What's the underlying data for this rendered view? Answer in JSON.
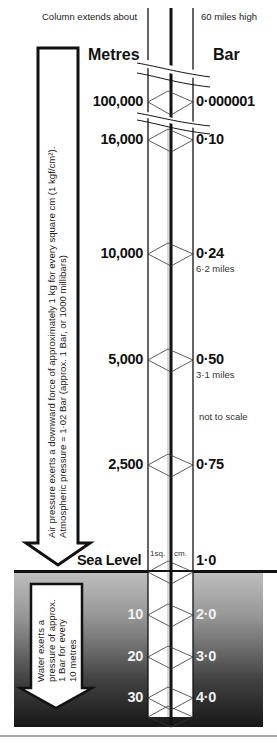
{
  "top_notes": {
    "left": "Column extends about",
    "right": "60 miles high"
  },
  "headers": {
    "metres": "Metres",
    "bar": "Bar"
  },
  "air_levels": [
    {
      "metres": "100,000",
      "bar": "0·000001",
      "note": ""
    },
    {
      "metres": "16,000",
      "bar": "0·10",
      "note": ""
    },
    {
      "metres": "10,000",
      "bar": "0·24",
      "note": "6·2 miles"
    },
    {
      "metres": "5,000",
      "bar": "0·50",
      "note": "3·1 miles"
    },
    {
      "metres": "2,500",
      "bar": "0·75",
      "note": ""
    }
  ],
  "not_to_scale": "not to scale",
  "sea_level": {
    "label": "Sea Level",
    "bar": "1·0",
    "column_label_left": "1sq.",
    "column_label_right": "cm."
  },
  "water_levels": [
    {
      "metres": "10",
      "bar": "2·0"
    },
    {
      "metres": "20",
      "bar": "3·0"
    },
    {
      "metres": "30",
      "bar": "4·0"
    }
  ],
  "air_arrow_text": {
    "line1": "Air pressure exerts a downward force of approximately 1 kg for every square cm (1 kgf/cm²).",
    "line2": "Atmospheric pressure = 1·02 Bar (approx. 1 Bar, or 1000 millibars)"
  },
  "water_arrow_text": {
    "line1": "Water exerts a",
    "line2": "pressure of approx.",
    "line3": "1 Bar for every",
    "line4": "10 metres"
  },
  "colors": {
    "ink": "#111111",
    "water_top": "#d8d8d8",
    "water_bottom": "#1a1a1a"
  }
}
